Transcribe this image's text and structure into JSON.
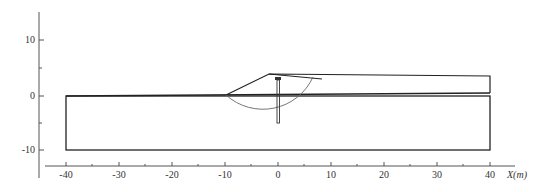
{
  "diagram": {
    "type": "slope-stability-cross-section",
    "x_axis": {
      "label": "X(m)",
      "ticks": [
        "-40",
        "-30",
        "-20",
        "-10",
        "0",
        "10",
        "20",
        "30",
        "40"
      ]
    },
    "y_axis": {
      "ticks": [
        "10",
        "0",
        "-10"
      ]
    },
    "geometry": {
      "ground_box": {
        "x_min": -40,
        "x_max": 40,
        "y_min": -10,
        "y_max": 0
      },
      "embankment_top_y": 3.5,
      "crest_x": -2,
      "slip_circle": {
        "note": "circular slip surface through embankment"
      },
      "pile": {
        "x": 0,
        "top_y": 3.2,
        "bottom_y": -5
      }
    },
    "colors": {
      "line": "#222222",
      "axis": "#555555",
      "circle": "#666666"
    }
  }
}
